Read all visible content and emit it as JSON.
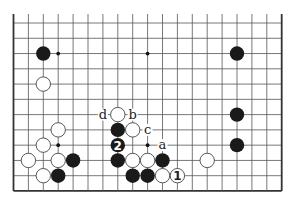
{
  "diagram": {
    "type": "go-board-partial",
    "columns": 19,
    "visible_rows": 12,
    "edges": {
      "left": true,
      "right": true,
      "bottom": true,
      "top": false
    },
    "colors": {
      "line": "#555555",
      "edge": "#333333",
      "black": "#1a1a1a",
      "white": "#ffffff",
      "background": "#ffffff"
    },
    "star_points": [
      [
        3,
        2
      ],
      [
        9,
        2
      ],
      [
        15,
        2
      ],
      [
        3,
        8
      ],
      [
        9,
        8
      ]
    ],
    "stones": [
      {
        "col": 2,
        "row": 2,
        "color": "black",
        "label": ""
      },
      {
        "col": 15,
        "row": 2,
        "color": "black",
        "label": ""
      },
      {
        "col": 2,
        "row": 4,
        "color": "white",
        "label": ""
      },
      {
        "col": 15,
        "row": 6,
        "color": "black",
        "label": ""
      },
      {
        "col": 15,
        "row": 8,
        "color": "black",
        "label": ""
      },
      {
        "col": 13,
        "row": 9,
        "color": "white",
        "label": ""
      },
      {
        "col": 3,
        "row": 7,
        "color": "white",
        "label": ""
      },
      {
        "col": 2,
        "row": 8,
        "color": "white",
        "label": ""
      },
      {
        "col": 1,
        "row": 9,
        "color": "white",
        "label": ""
      },
      {
        "col": 3,
        "row": 9,
        "color": "white",
        "label": ""
      },
      {
        "col": 4,
        "row": 9,
        "color": "black",
        "label": ""
      },
      {
        "col": 2,
        "row": 10,
        "color": "white",
        "label": ""
      },
      {
        "col": 3,
        "row": 10,
        "color": "black",
        "label": ""
      },
      {
        "col": 7,
        "row": 6,
        "color": "white",
        "label": ""
      },
      {
        "col": 7,
        "row": 7,
        "color": "black",
        "label": ""
      },
      {
        "col": 8,
        "row": 7,
        "color": "white",
        "label": ""
      },
      {
        "col": 7,
        "row": 8,
        "color": "black",
        "label": "2"
      },
      {
        "col": 7,
        "row": 9,
        "color": "black",
        "label": ""
      },
      {
        "col": 8,
        "row": 9,
        "color": "white",
        "label": ""
      },
      {
        "col": 9,
        "row": 9,
        "color": "white",
        "label": ""
      },
      {
        "col": 10,
        "row": 9,
        "color": "black",
        "label": ""
      },
      {
        "col": 8,
        "row": 10,
        "color": "black",
        "label": ""
      },
      {
        "col": 9,
        "row": 10,
        "color": "black",
        "label": ""
      },
      {
        "col": 10,
        "row": 10,
        "color": "white",
        "label": ""
      },
      {
        "col": 11,
        "row": 10,
        "color": "white",
        "label": "1"
      }
    ],
    "point_labels": [
      {
        "col": 6,
        "row": 6,
        "text": "d"
      },
      {
        "col": 8,
        "row": 6,
        "text": "b"
      },
      {
        "col": 9,
        "row": 7,
        "text": "c"
      },
      {
        "col": 10,
        "row": 8,
        "text": "a"
      }
    ]
  }
}
